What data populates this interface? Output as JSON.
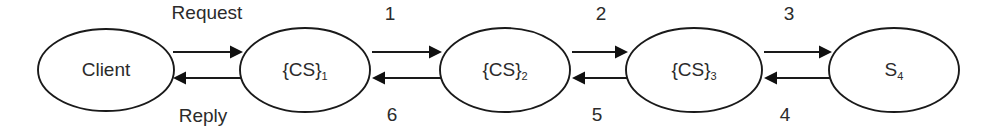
{
  "diagram": {
    "type": "node-link-chain",
    "background_color": "#ffffff",
    "line_color": "#1a1a1a",
    "text_color": "#2b2b2b",
    "nodes": [
      {
        "id": "client",
        "base": "Client",
        "sub": "",
        "cx": 106,
        "cy": 70,
        "rx": 68,
        "ry": 41
      },
      {
        "id": "cs1",
        "base": "{CS}",
        "sub": "1",
        "cx": 305,
        "cy": 70,
        "rx": 65,
        "ry": 42
      },
      {
        "id": "cs2",
        "base": "{CS}",
        "sub": "2",
        "cx": 505,
        "cy": 70,
        "rx": 65,
        "ry": 42
      },
      {
        "id": "cs3",
        "base": "{CS}",
        "sub": "3",
        "cx": 694,
        "cy": 70,
        "rx": 68,
        "ry": 42
      },
      {
        "id": "s4",
        "base": "S",
        "sub": "4",
        "cx": 894,
        "cy": 70,
        "rx": 65,
        "ry": 42
      }
    ],
    "edges": [
      {
        "id": "client-to-cs1",
        "from": "client",
        "to": "cs1",
        "direction": "forward",
        "label": "Request",
        "label_position": "above",
        "x1": 173,
        "x2": 243,
        "y": 52,
        "label_x": 207,
        "label_y": 14
      },
      {
        "id": "cs1-to-client",
        "from": "cs1",
        "to": "client",
        "direction": "backward",
        "label": "Reply",
        "label_position": "below",
        "x1": 173,
        "x2": 243,
        "y": 78,
        "label_x": 203,
        "label_y": 117
      },
      {
        "id": "cs1-to-cs2",
        "from": "cs1",
        "to": "cs2",
        "direction": "forward",
        "label": "1",
        "label_position": "above",
        "x1": 372,
        "x2": 442,
        "y": 52,
        "label_x": 390,
        "label_y": 15
      },
      {
        "id": "cs2-to-cs1",
        "from": "cs2",
        "to": "cs1",
        "direction": "backward",
        "label": "6",
        "label_position": "below",
        "x1": 372,
        "x2": 442,
        "y": 78,
        "label_x": 392,
        "label_y": 116
      },
      {
        "id": "cs2-to-cs3",
        "from": "cs2",
        "to": "cs3",
        "direction": "forward",
        "label": "2",
        "label_position": "above",
        "x1": 572,
        "x2": 628,
        "y": 52,
        "label_x": 601,
        "label_y": 15
      },
      {
        "id": "cs3-to-cs2",
        "from": "cs3",
        "to": "cs2",
        "direction": "backward",
        "label": "5",
        "label_position": "below",
        "x1": 572,
        "x2": 628,
        "y": 78,
        "label_x": 597,
        "label_y": 116
      },
      {
        "id": "cs3-to-s4",
        "from": "cs3",
        "to": "s4",
        "direction": "forward",
        "label": "3",
        "label_position": "above",
        "x1": 764,
        "x2": 832,
        "y": 52,
        "label_x": 789,
        "label_y": 15
      },
      {
        "id": "s4-to-cs3",
        "from": "s4",
        "to": "cs3",
        "direction": "backward",
        "label": "4",
        "label_position": "below",
        "x1": 764,
        "x2": 832,
        "y": 78,
        "label_x": 785,
        "label_y": 116
      }
    ]
  }
}
